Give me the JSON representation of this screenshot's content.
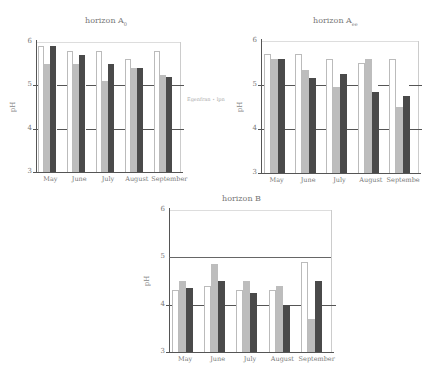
{
  "chart_data": [
    {
      "type": "bar",
      "title": "horizon A",
      "title_sub": "0",
      "xlabel": "",
      "ylabel": "pH",
      "ylim": [
        3,
        6
      ],
      "yticks": [
        3,
        4,
        5,
        6
      ],
      "categories": [
        "May",
        "June",
        "July",
        "August",
        "September"
      ],
      "series": [
        {
          "name": "series 1 (white)",
          "color": "#ffffff",
          "values": [
            5.9,
            5.8,
            5.8,
            5.6,
            5.8
          ]
        },
        {
          "name": "series 2 (light gray)",
          "color": "#bdbdbd",
          "values": [
            5.5,
            5.5,
            5.1,
            5.4,
            5.25
          ]
        },
        {
          "name": "series 3 (dark gray)",
          "color": "#4a4a4a",
          "values": [
            5.9,
            5.7,
            5.5,
            5.4,
            5.2
          ]
        }
      ],
      "annotation": "Egenfran ⋆ lpn",
      "grid": "partial horizontal lines at 4 and 5"
    },
    {
      "type": "bar",
      "title": "horizon A",
      "title_sub": "ee",
      "xlabel": "",
      "ylabel": "pH",
      "ylim": [
        3,
        6
      ],
      "yticks": [
        3,
        4,
        5,
        6
      ],
      "categories": [
        "May",
        "June",
        "July",
        "August",
        "September"
      ],
      "series": [
        {
          "name": "series 1 (white)",
          "color": "#ffffff",
          "values": [
            5.7,
            5.7,
            5.6,
            5.5,
            5.6
          ]
        },
        {
          "name": "series 2 (light gray)",
          "color": "#bdbdbd",
          "values": [
            5.6,
            5.35,
            4.95,
            5.6,
            4.5
          ]
        },
        {
          "name": "series 3 (dark gray)",
          "color": "#4a4a4a",
          "values": [
            5.6,
            5.15,
            5.25,
            4.85,
            4.75
          ]
        }
      ],
      "grid": "partial horizontal lines at 4 and 5"
    },
    {
      "type": "bar",
      "title": "horizon B",
      "title_sub": "",
      "xlabel": "",
      "ylabel": "pH",
      "ylim": [
        3,
        6
      ],
      "yticks": [
        3,
        4,
        5,
        6
      ],
      "categories": [
        "May",
        "June",
        "July",
        "August",
        "September"
      ],
      "series": [
        {
          "name": "series 1 (white)",
          "color": "#ffffff",
          "values": [
            4.3,
            4.4,
            4.3,
            4.3,
            4.9
          ]
        },
        {
          "name": "series 2 (light gray)",
          "color": "#bdbdbd",
          "values": [
            4.5,
            4.85,
            4.5,
            4.4,
            3.7
          ]
        },
        {
          "name": "series 3 (dark gray)",
          "color": "#4a4a4a",
          "values": [
            4.35,
            4.5,
            4.25,
            4.0,
            4.5
          ]
        }
      ],
      "grid": "full line at 5, partial lines at 4"
    }
  ],
  "charts": [
    {
      "title": "horizon A",
      "sub": "0",
      "ylabel": "pH",
      "ticks": [
        "3",
        "4",
        "5",
        "6"
      ],
      "months": [
        "May",
        "June",
        "July",
        "August",
        "September"
      ],
      "note": "Egenfran ⋆ lpn"
    },
    {
      "title": "horizon A",
      "sub": "ee",
      "ylabel": "pH",
      "ticks": [
        "3",
        "4",
        "5",
        "6"
      ],
      "months": [
        "May",
        "June",
        "July",
        "August",
        "Septembe"
      ]
    },
    {
      "title": "horizon B",
      "sub": "",
      "ylabel": "pH",
      "ticks": [
        "3",
        "4",
        "5",
        "6"
      ],
      "months": [
        "May",
        "June",
        "July",
        "August",
        "September"
      ]
    }
  ]
}
